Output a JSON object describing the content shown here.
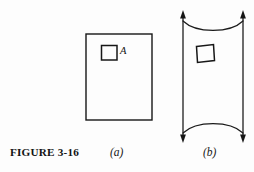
{
  "figure": {
    "caption": "FIGURE 3-16",
    "background_color": "#fdfdfd",
    "ink_color": "#161616",
    "width": 254,
    "height": 172,
    "panels": [
      {
        "id": "a",
        "label": "(a)",
        "description": "undeformed rectangular body with small square element A",
        "element_label": "A",
        "outer_rect": {
          "x": 86,
          "y": 34,
          "width": 66,
          "height": 86
        },
        "small_square": {
          "x": 101,
          "y": 45,
          "width": 16,
          "height": 15
        }
      },
      {
        "id": "b",
        "label": "(b)",
        "description": "body under vertical tension, sides drawn inward, top and bottom edges curved, element deformed",
        "left_edge_x": 183,
        "right_edge_x": 243,
        "top_y": 18,
        "bottom_y": 134,
        "arrow_count": 4,
        "arrow_directions": [
          "up",
          "up",
          "down",
          "down"
        ],
        "small_quad": {
          "x": 196,
          "y": 44,
          "width": 18,
          "height": 18
        }
      }
    ]
  }
}
